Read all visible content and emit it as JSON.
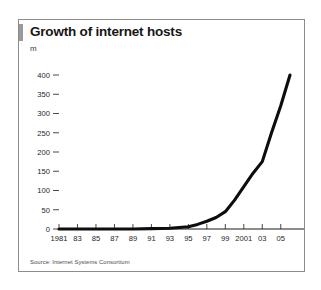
{
  "card": {
    "accent_color": "#9a9a9a",
    "border_color": "#8c8c8c"
  },
  "chart_data": {
    "type": "line",
    "title": "Growth of internet hosts",
    "subtitle": "",
    "unit_label": "m",
    "xlabel": "",
    "ylabel": "m",
    "ylim": [
      0,
      400
    ],
    "xlim": [
      1981,
      2006
    ],
    "grid": false,
    "legend": false,
    "line_color": "#0d0d0d",
    "ytick_values": [
      0,
      50,
      100,
      150,
      200,
      250,
      300,
      350,
      400
    ],
    "ytick_labels": [
      "0",
      "50",
      "100",
      "150",
      "200",
      "250",
      "300",
      "350",
      "400"
    ],
    "xtick_values": [
      1981,
      1983,
      1985,
      1987,
      1989,
      1991,
      1993,
      1995,
      1997,
      1999,
      2001,
      2003,
      2005
    ],
    "xtick_labels": [
      "1981",
      "83",
      "85",
      "87",
      "89",
      "91",
      "93",
      "95",
      "97",
      "99",
      "2001",
      "03",
      "05"
    ],
    "series": [
      {
        "name": "Internet hosts",
        "x": [
          1981,
          1983,
          1985,
          1987,
          1989,
          1991,
          1993,
          1995,
          1996,
          1997,
          1998,
          1999,
          2000,
          2001,
          2002,
          2003,
          2004,
          2005,
          2006
        ],
        "values": [
          0,
          0,
          0,
          0,
          0,
          1,
          2,
          6,
          12,
          20,
          30,
          45,
          75,
          110,
          145,
          175,
          250,
          320,
          400
        ]
      }
    ],
    "source": "Source: Internet Systems Consortium"
  }
}
